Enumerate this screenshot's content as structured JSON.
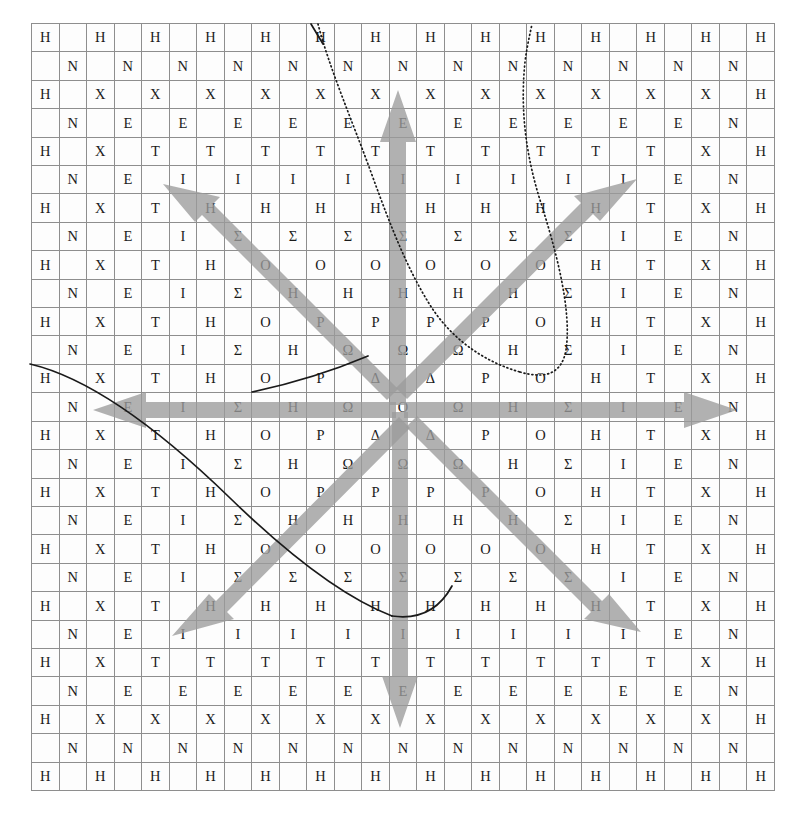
{
  "figure": {
    "kind": "letter-grid-with-arrows",
    "grid_cols": 27,
    "grid_rows": 27,
    "alphabet_sequence": [
      "H",
      "N",
      "X",
      "E",
      "T",
      "I",
      "H",
      "Σ",
      "O",
      "H",
      "P",
      "Ω",
      "Δ",
      "O",
      "Δ",
      "Ω",
      "P",
      "H",
      "O",
      "Σ",
      "H",
      "I",
      "T",
      "E",
      "X",
      "N",
      "H"
    ],
    "center_sequence": [
      "O",
      "E",
      "Θ",
      "Y",
      "O",
      "P",
      "H",
      "M",
      "O",
      "Σ",
      "A",
      "I",
      "Λ",
      "I",
      "Λ",
      "I",
      "A",
      "Σ",
      "O",
      "M",
      "H",
      "P",
      "O",
      "Y",
      "Θ",
      "E",
      "O"
    ],
    "center_letter": "Λ",
    "grid_line_color": "#8e8e8e",
    "cell_background": "#fdfdfd",
    "letter_color": "#1b1b1b",
    "arrow_color": "#9a9a9a",
    "curve_color": "#1a1a1a",
    "arrow_count": 8,
    "arrow_directions": [
      "up",
      "down",
      "left",
      "right",
      "up-left",
      "up-right",
      "down-left",
      "down-right"
    ],
    "rows": [
      [
        "H",
        "",
        "N",
        "",
        "X",
        "",
        "E",
        "",
        "T",
        "",
        "I",
        "",
        "H",
        "",
        "Σ",
        "",
        "O",
        "",
        "H",
        "",
        "P",
        "",
        "Ω",
        "",
        "Δ",
        "",
        "O"
      ],
      [
        "",
        "N",
        "",
        "X",
        "",
        "E",
        "",
        "T",
        "",
        "I",
        "",
        "H",
        "",
        "Σ",
        "",
        "O",
        "",
        "H",
        "",
        "P",
        "",
        "Ω",
        "",
        "Δ",
        "",
        "O",
        "",
        "Δ"
      ],
      [
        "N",
        "",
        "X",
        "",
        "E",
        "",
        "T",
        "",
        "I",
        "",
        "H",
        "",
        "Σ",
        "",
        "O",
        "",
        "H",
        "",
        "P",
        "",
        "Ω",
        "",
        "Δ",
        "",
        "O",
        "",
        "Δ"
      ],
      [
        "",
        "X",
        "",
        "E",
        "",
        "T",
        "",
        "I",
        "",
        "H",
        "",
        "Σ",
        "",
        "O",
        "",
        "H",
        "",
        "P",
        "",
        "Ω",
        "",
        "Δ",
        "",
        "O",
        "",
        "Δ",
        ""
      ],
      [
        "X",
        "",
        "E",
        "",
        "T",
        "",
        "I",
        "",
        "H",
        "",
        "Σ",
        "",
        "O",
        "",
        "H",
        "",
        "P",
        "",
        "Ω",
        "",
        "Δ",
        "",
        "O",
        "",
        "Δ",
        "",
        "Ω"
      ],
      [
        "",
        "E",
        "",
        "T",
        "",
        "I",
        "",
        "H",
        "",
        "Σ",
        "",
        "O",
        "",
        "H",
        "",
        "P",
        "",
        "Ω",
        "",
        "Δ",
        "",
        "O",
        "",
        "Δ",
        "",
        "Ω",
        ""
      ],
      [
        "E",
        "",
        "T",
        "",
        "I",
        "",
        "H",
        "",
        "Σ",
        "",
        "O",
        "",
        "H",
        "",
        "P",
        "",
        "Ω",
        "",
        "Δ",
        "",
        "O",
        "",
        "Δ",
        "",
        "Ω",
        "",
        "P"
      ],
      [
        "",
        "T",
        "",
        "I",
        "",
        "H",
        "",
        "Σ",
        "",
        "O",
        "",
        "H",
        "",
        "P",
        "",
        "Ω",
        "",
        "Δ",
        "",
        "O",
        "",
        "Δ",
        "",
        "Ω",
        "",
        "P",
        ""
      ],
      [
        "T",
        "",
        "I",
        "",
        "H",
        "",
        "Σ",
        "",
        "O",
        "",
        "H",
        "",
        "P",
        "",
        "Ω",
        "",
        "Δ",
        "",
        "O",
        "",
        "Δ",
        "",
        "Ω",
        "",
        "P",
        "",
        "H"
      ],
      [
        "",
        "I",
        "",
        "H",
        "",
        "Σ",
        "",
        "O",
        "",
        "H",
        "",
        "P",
        "",
        "Ω",
        "",
        "Δ",
        "",
        "O",
        "",
        "Δ",
        "",
        "Ω",
        "",
        "P",
        "",
        "H",
        ""
      ],
      [
        "I",
        "",
        "H",
        "",
        "Σ",
        "",
        "O",
        "",
        "H",
        "",
        "P",
        "",
        "Ω",
        "",
        "Δ",
        "",
        "O",
        "",
        "Δ",
        "",
        "Ω",
        "",
        "P",
        "",
        "H",
        "",
        "O"
      ],
      [
        "",
        "H",
        "",
        "Σ",
        "",
        "O",
        "",
        "H",
        "",
        "P",
        "",
        "Ω",
        "",
        "Δ",
        "",
        "O",
        "",
        "Δ",
        "",
        "Ω",
        "",
        "P",
        "",
        "H",
        "",
        "O",
        ""
      ],
      [
        "H",
        "",
        "Σ",
        "",
        "O",
        "",
        "H",
        "",
        "P",
        "",
        "Ω",
        "",
        "Δ",
        "",
        "O",
        "",
        "Δ",
        "",
        "Ω",
        "",
        "P",
        "",
        "H",
        "",
        "O",
        "",
        "Σ"
      ],
      [
        "",
        "Σ",
        "",
        "O",
        "",
        "H",
        "",
        "P",
        "",
        "Ω",
        "",
        "Δ",
        "",
        "O",
        "",
        "Δ",
        "",
        "Ω",
        "",
        "P",
        "",
        "H",
        "",
        "O",
        "",
        "Σ",
        ""
      ],
      [
        "Σ",
        "",
        "O",
        "",
        "H",
        "",
        "P",
        "",
        "Ω",
        "",
        "Δ",
        "",
        "O",
        "",
        "Δ",
        "",
        "Ω",
        "",
        "P",
        "",
        "H",
        "",
        "O",
        "",
        "Σ",
        "",
        "H"
      ],
      [
        "",
        "O",
        "",
        "H",
        "",
        "P",
        "",
        "Ω",
        "",
        "Δ",
        "",
        "O",
        "",
        "Δ",
        "",
        "Ω",
        "",
        "P",
        "",
        "H",
        "",
        "O",
        "",
        "Σ",
        "",
        "H",
        ""
      ],
      [
        "O",
        "",
        "H",
        "",
        "P",
        "",
        "Ω",
        "",
        "Δ",
        "",
        "O",
        "",
        "Δ",
        "",
        "Ω",
        "",
        "P",
        "",
        "H",
        "",
        "O",
        "",
        "Σ",
        "",
        "H",
        "",
        "I"
      ],
      [
        "",
        "H",
        "",
        "P",
        "",
        "Ω",
        "",
        "Δ",
        "",
        "O",
        "",
        "Δ",
        "",
        "Ω",
        "",
        "P",
        "",
        "H",
        "",
        "O",
        "",
        "Σ",
        "",
        "H",
        "",
        "I",
        ""
      ],
      [
        "H",
        "",
        "P",
        "",
        "Ω",
        "",
        "Δ",
        "",
        "O",
        "",
        "Δ",
        "",
        "Ω",
        "",
        "P",
        "",
        "H",
        "",
        "O",
        "",
        "Σ",
        "",
        "H",
        "",
        "I",
        "",
        "T"
      ],
      [
        "",
        "P",
        "",
        "Ω",
        "",
        "Δ",
        "",
        "O",
        "",
        "Δ",
        "",
        "Ω",
        "",
        "P",
        "",
        "H",
        "",
        "O",
        "",
        "Σ",
        "",
        "H",
        "",
        "I",
        "",
        "T",
        ""
      ],
      [
        "P",
        "",
        "Ω",
        "",
        "Δ",
        "",
        "O",
        "",
        "Δ",
        "",
        "Ω",
        "",
        "P",
        "",
        "H",
        "",
        "O",
        "",
        "Σ",
        "",
        "H",
        "",
        "I",
        "",
        "T",
        "",
        "E"
      ],
      [
        "",
        "Ω",
        "",
        "Δ",
        "",
        "O",
        "",
        "Δ",
        "",
        "Ω",
        "",
        "P",
        "",
        "H",
        "",
        "O",
        "",
        "Σ",
        "",
        "H",
        "",
        "I",
        "",
        "T",
        "",
        "E",
        ""
      ],
      [
        "Ω",
        "",
        "Δ",
        "",
        "O",
        "",
        "Δ",
        "",
        "Ω",
        "",
        "P",
        "",
        "H",
        "",
        "O",
        "",
        "Σ",
        "",
        "H",
        "",
        "I",
        "",
        "T",
        "",
        "E",
        "",
        "X"
      ],
      [
        "",
        "Δ",
        "",
        "O",
        "",
        "Δ",
        "",
        "Ω",
        "",
        "P",
        "",
        "H",
        "",
        "O",
        "",
        "Σ",
        "",
        "H",
        "",
        "I",
        "",
        "T",
        "",
        "E",
        "",
        "X",
        ""
      ],
      [
        "Δ",
        "",
        "O",
        "",
        "Δ",
        "",
        "Ω",
        "",
        "P",
        "",
        "H",
        "",
        "O",
        "",
        "Σ",
        "",
        "H",
        "",
        "I",
        "",
        "T",
        "",
        "E",
        "",
        "X",
        "",
        "N"
      ],
      [
        "",
        "O",
        "",
        "Δ",
        "",
        "Ω",
        "",
        "P",
        "",
        "H",
        "",
        "O",
        "",
        "Σ",
        "",
        "H",
        "",
        "I",
        "",
        "T",
        "",
        "E",
        "",
        "X",
        "",
        "N",
        ""
      ],
      [
        "O",
        "",
        "Δ",
        "",
        "Ω",
        "",
        "P",
        "",
        "H",
        "",
        "O",
        "",
        "Σ",
        "",
        "H",
        "",
        "I",
        "",
        "T",
        "",
        "E",
        "",
        "X",
        "",
        "N",
        "",
        "H"
      ]
    ]
  }
}
